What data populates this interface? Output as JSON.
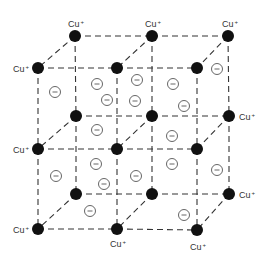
{
  "diagram": {
    "type": "crystal-lattice",
    "cation_label": "Cu",
    "cation_charge": "+",
    "anion_symbol": "−",
    "colors": {
      "cation": "#111111",
      "edge": "#333333",
      "anion": "#555555",
      "background": "#ffffff"
    },
    "cations": [
      {
        "x": 75,
        "y": 36
      },
      {
        "x": 152,
        "y": 36
      },
      {
        "x": 228,
        "y": 36
      },
      {
        "x": 38,
        "y": 68
      },
      {
        "x": 117,
        "y": 68
      },
      {
        "x": 197,
        "y": 68
      },
      {
        "x": 76,
        "y": 116
      },
      {
        "x": 152,
        "y": 116
      },
      {
        "x": 229,
        "y": 116
      },
      {
        "x": 38,
        "y": 149
      },
      {
        "x": 117,
        "y": 149
      },
      {
        "x": 197,
        "y": 149
      },
      {
        "x": 76,
        "y": 194
      },
      {
        "x": 152,
        "y": 194
      },
      {
        "x": 229,
        "y": 194
      },
      {
        "x": 38,
        "y": 229
      },
      {
        "x": 117,
        "y": 229
      },
      {
        "x": 197,
        "y": 230
      }
    ],
    "labels": [
      {
        "text": "Cu",
        "sup": "+",
        "x": 68,
        "y": 27
      },
      {
        "text": "Cu",
        "sup": "+",
        "x": 145,
        "y": 27
      },
      {
        "text": "Cu",
        "sup": "+",
        "x": 222,
        "y": 27
      },
      {
        "text": "Cu",
        "sup": "+",
        "x": 13,
        "y": 72
      },
      {
        "text": "Cu",
        "sup": "+",
        "x": 13,
        "y": 153
      },
      {
        "text": "Cu",
        "sup": "+",
        "x": 13,
        "y": 233
      },
      {
        "text": "Cu",
        "sup": "+",
        "x": 239,
        "y": 120
      },
      {
        "text": "Cu",
        "sup": "+",
        "x": 239,
        "y": 198
      },
      {
        "text": "Cu",
        "sup": "+",
        "x": 110,
        "y": 247
      },
      {
        "text": "Cu",
        "sup": "+",
        "x": 190,
        "y": 250
      }
    ],
    "anions": [
      {
        "x": 55,
        "y": 92
      },
      {
        "x": 97,
        "y": 84
      },
      {
        "x": 107,
        "y": 100
      },
      {
        "x": 137,
        "y": 80
      },
      {
        "x": 135,
        "y": 101
      },
      {
        "x": 173,
        "y": 84
      },
      {
        "x": 184,
        "y": 106
      },
      {
        "x": 217,
        "y": 69
      },
      {
        "x": 97,
        "y": 130
      },
      {
        "x": 172,
        "y": 136
      },
      {
        "x": 56,
        "y": 176
      },
      {
        "x": 96,
        "y": 164
      },
      {
        "x": 104,
        "y": 184
      },
      {
        "x": 136,
        "y": 176
      },
      {
        "x": 172,
        "y": 164
      },
      {
        "x": 217,
        "y": 170
      },
      {
        "x": 90,
        "y": 211
      },
      {
        "x": 184,
        "y": 215
      }
    ]
  }
}
